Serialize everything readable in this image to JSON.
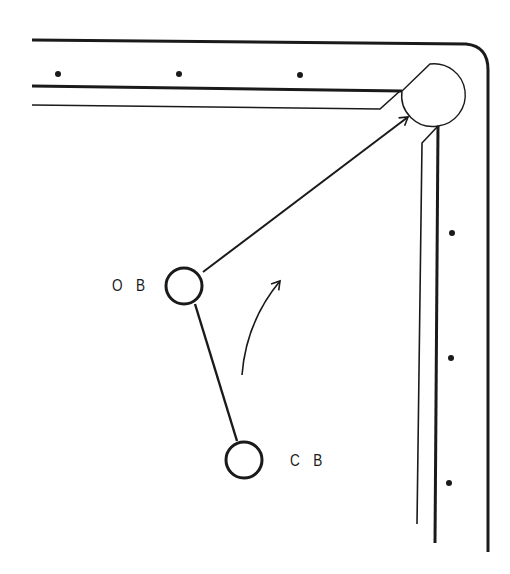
{
  "diagram": {
    "type": "billiards-shot-diagram",
    "labels": {
      "object_ball": "O B",
      "cue_ball": "C B"
    },
    "balls": [
      {
        "id": "object_ball",
        "label": "O B",
        "cx": 184,
        "cy": 286,
        "r": 18
      },
      {
        "id": "cue_ball",
        "label": "C B",
        "cx": 244,
        "cy": 460,
        "r": 18
      }
    ],
    "diamonds": {
      "top_rail": [
        {
          "x": 58,
          "y": 74
        },
        {
          "x": 179,
          "y": 74
        },
        {
          "x": 300,
          "y": 75
        }
      ],
      "right_rail": [
        {
          "x": 452,
          "y": 233
        },
        {
          "x": 451,
          "y": 358
        },
        {
          "x": 449,
          "y": 483
        }
      ]
    },
    "paths": {
      "cue_to_object": {
        "from": [
          237,
          441
        ],
        "to": [
          195,
          304
        ]
      },
      "object_to_pocket": {
        "from": [
          203,
          272
        ],
        "to": [
          408,
          117
        ],
        "arrow": true
      },
      "rotation_arrow": {
        "from": [
          242,
          375
        ],
        "to": [
          280,
          280
        ],
        "curved": true
      }
    },
    "colors": {
      "ink": "#1a1a1a",
      "background": "#ffffff"
    }
  }
}
